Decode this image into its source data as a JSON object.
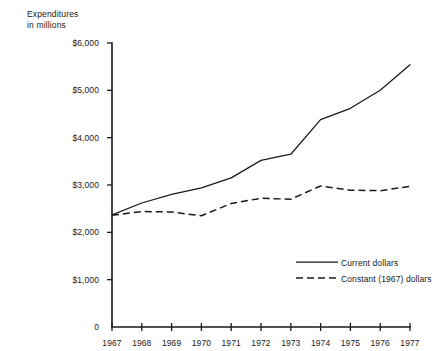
{
  "chart_data": {
    "type": "line",
    "title": "",
    "ylabel": "Expenditures\nin millions",
    "xlabel": "",
    "categories": [
      "1967",
      "1968",
      "1969",
      "1970",
      "1971",
      "1972",
      "1973",
      "1974",
      "1975",
      "1976",
      "1977"
    ],
    "x": [
      1967,
      1968,
      1969,
      1970,
      1971,
      1972,
      1973,
      1974,
      1975,
      1976,
      1977
    ],
    "ylim": [
      0,
      6000
    ],
    "xlim": [
      1967,
      1977
    ],
    "ytick_labels": [
      "$6,000",
      "$5,000",
      "$4,000",
      "$3,000",
      "$2,000",
      "$1,000",
      "0"
    ],
    "ytick_values": [
      6000,
      5000,
      4000,
      3000,
      2000,
      1000,
      0
    ],
    "grid": false,
    "legend_position": "inside-lower-right",
    "series": [
      {
        "name": "Current dollars",
        "style": "solid",
        "values": [
          2370,
          2620,
          2800,
          2940,
          3150,
          3520,
          3650,
          4380,
          4620,
          5000,
          5540
        ]
      },
      {
        "name": "Constant (1967) dollars",
        "style": "dashed",
        "values": [
          2360,
          2440,
          2430,
          2350,
          2610,
          2720,
          2700,
          2980,
          2890,
          2880,
          2970
        ]
      }
    ],
    "legend": [
      {
        "label": "Current dollars",
        "style": "solid"
      },
      {
        "label": "Constant (1967) dollars",
        "style": "dashed"
      }
    ],
    "colors": {
      "line": "#1a1a1a",
      "background": "#ffffff"
    }
  }
}
